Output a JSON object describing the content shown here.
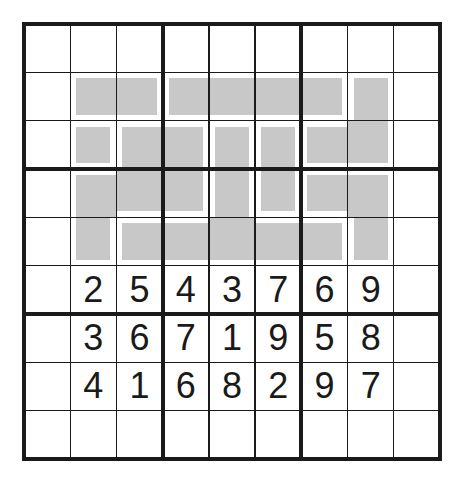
{
  "puzzle": {
    "type": "sudoku-variant",
    "size": 9,
    "box": 3,
    "colors": {
      "grid_line": "#1a1a1a",
      "shade": "#c8c8c8",
      "background": "#ffffff"
    },
    "grid": [
      [
        "",
        "",
        "",
        "",
        "",
        "",
        "",
        "",
        ""
      ],
      [
        "",
        "",
        "",
        "",
        "",
        "",
        "",
        "",
        ""
      ],
      [
        "",
        "",
        "",
        "",
        "",
        "",
        "",
        "",
        ""
      ],
      [
        "",
        "",
        "",
        "",
        "",
        "",
        "",
        "",
        ""
      ],
      [
        "",
        "",
        "",
        "",
        "",
        "",
        "",
        "",
        ""
      ],
      [
        "",
        "2",
        "5",
        "4",
        "3",
        "7",
        "6",
        "9",
        ""
      ],
      [
        "",
        "3",
        "6",
        "7",
        "1",
        "9",
        "5",
        "8",
        ""
      ],
      [
        "",
        "4",
        "1",
        "6",
        "8",
        "2",
        "9",
        "7",
        ""
      ],
      [
        "",
        "",
        "",
        "",
        "",
        "",
        "",
        "",
        ""
      ]
    ],
    "shaded_pieces": [
      {
        "id": "P1",
        "cells": [
          [
            1,
            1
          ],
          [
            1,
            2
          ]
        ]
      },
      {
        "id": "P2",
        "cells": [
          [
            1,
            3
          ],
          [
            1,
            4
          ],
          [
            1,
            5
          ],
          [
            1,
            6
          ]
        ]
      },
      {
        "id": "P3",
        "cells": [
          [
            1,
            7
          ],
          [
            2,
            6
          ],
          [
            2,
            7
          ]
        ]
      },
      {
        "id": "P4",
        "cells": [
          [
            2,
            1
          ]
        ]
      },
      {
        "id": "P5",
        "cells": [
          [
            2,
            2
          ],
          [
            2,
            3
          ],
          [
            3,
            1
          ],
          [
            3,
            2
          ],
          [
            3,
            3
          ],
          [
            4,
            1
          ]
        ]
      },
      {
        "id": "P6",
        "cells": [
          [
            2,
            4
          ],
          [
            3,
            4
          ],
          [
            4,
            2
          ],
          [
            4,
            3
          ],
          [
            4,
            4
          ],
          [
            4,
            5
          ],
          [
            4,
            6
          ]
        ]
      },
      {
        "id": "P7",
        "cells": [
          [
            2,
            5
          ],
          [
            3,
            5
          ]
        ]
      },
      {
        "id": "P8",
        "cells": [
          [
            3,
            6
          ],
          [
            3,
            7
          ],
          [
            4,
            7
          ]
        ]
      }
    ]
  }
}
